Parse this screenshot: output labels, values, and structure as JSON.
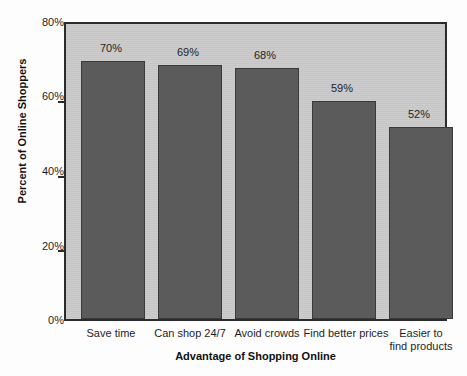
{
  "chart_data": {
    "type": "bar",
    "title": "",
    "xlabel": "Advantage of Shopping Online",
    "ylabel": "Percent of Online Shoppers",
    "categories": [
      "Save time",
      "Can shop 24/7",
      "Avoid crowds",
      "Find better prices",
      "Easier to find products"
    ],
    "category_lines": [
      [
        "Save time"
      ],
      [
        "Can shop 24/7"
      ],
      [
        "Avoid crowds"
      ],
      [
        "Find better prices"
      ],
      [
        "Easier to",
        "find products"
      ]
    ],
    "values": [
      70,
      69,
      68,
      59,
      52
    ],
    "value_labels": [
      "70%",
      "69%",
      "68%",
      "59%",
      "52%"
    ],
    "ylim": [
      0,
      80
    ],
    "ytick_values": [
      0,
      20,
      40,
      60,
      80
    ],
    "ytick_labels": [
      "0%",
      "20%",
      "40%",
      "60%",
      "80%"
    ],
    "grid": false,
    "legend": false,
    "colors": {
      "bar_fill": "#5b5b5b",
      "bar_border": "#3a3a3a",
      "plot_background": "#c9c9c9",
      "plot_border": "#2b2b2b",
      "page_background": "#fdfdfd",
      "text": "#1f1f1f"
    }
  }
}
